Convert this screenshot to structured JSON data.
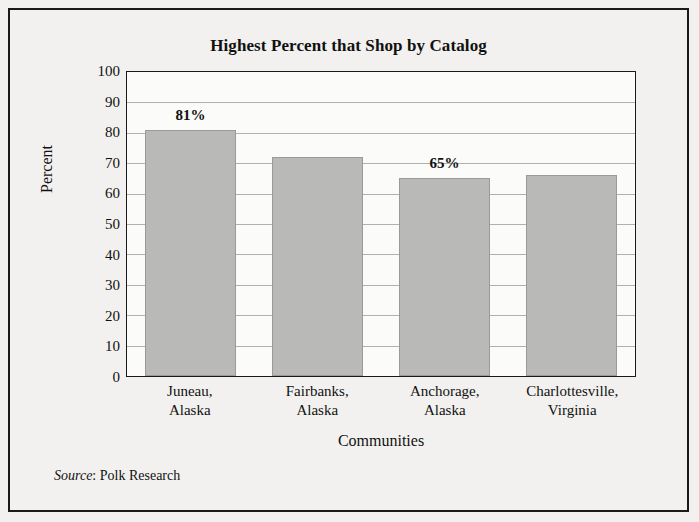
{
  "chart_data": {
    "type": "bar",
    "title": "Highest Percent that Shop by Catalog",
    "xlabel": "Communities",
    "ylabel": "Percent",
    "categories": [
      "Juneau,\nAlaska",
      "Fairbanks,\nAlaska",
      "Anchorage,\nAlaska",
      "Charlottesville,\nVirginia"
    ],
    "category_lines": [
      [
        "Juneau,",
        "Alaska"
      ],
      [
        "Fairbanks,",
        "Alaska"
      ],
      [
        "Anchorage,",
        "Alaska"
      ],
      [
        "Charlottesville,",
        "Virginia"
      ]
    ],
    "values": [
      81,
      72,
      65,
      66
    ],
    "data_labels": [
      "81%",
      "",
      "65%",
      ""
    ],
    "ylim": [
      0,
      100
    ],
    "ytick_step": 10,
    "yticks": [
      100,
      90,
      80,
      70,
      60,
      50,
      40,
      30,
      20,
      10,
      0
    ],
    "grid": true,
    "legend": "none",
    "bar_color": "#b9b9b7",
    "bar_border_color": "#9a9a98",
    "gridline_color": "#b0b0ae",
    "frame_color": "#1a1a1a"
  },
  "source": {
    "label": "Source",
    "separator": ": ",
    "value": "Polk Research"
  }
}
